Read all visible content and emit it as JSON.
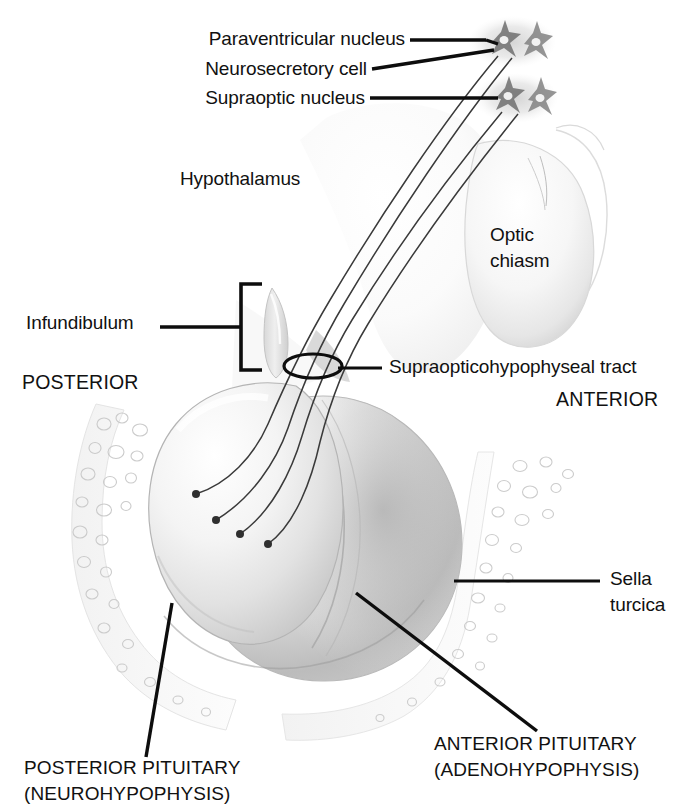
{
  "figure": {
    "background_color": "#ffffff",
    "ink_color": "#111111"
  },
  "labels": {
    "paraventricular_nucleus": "Paraventricular nucleus",
    "neurosecretory_cell": "Neurosecretory cell",
    "supraoptic_nucleus": "Supraoptic nucleus",
    "hypothalamus": "Hypothalamus",
    "optic_chiasm_line1": "Optic",
    "optic_chiasm_line2": "chiasm",
    "infundibulum": "Infundibulum",
    "posterior": "POSTERIOR",
    "anterior": "ANTERIOR",
    "supraopticohypophyseal_tract": "Supraopticohypophyseal tract",
    "sella_turcica_line1": "Sella",
    "sella_turcica_line2": "turcica",
    "posterior_pituitary_line1": "POSTERIOR PITUITARY",
    "posterior_pituitary_line2": "(NEUROHYPOPHYSIS)",
    "anterior_pituitary_line1": "ANTERIOR PITUITARY",
    "anterior_pituitary_line2": "(ADENOHYPOPHYSIS)"
  },
  "structures": [
    {
      "name": "paraventricular-nucleus",
      "description": "upper grey cell cluster with two star-shaped neurosecretory cells"
    },
    {
      "name": "supraoptic-nucleus",
      "description": "lower grey cell cluster with two star-shaped neurosecretory cells"
    },
    {
      "name": "optic-chiasm",
      "description": "large pale oval body, right of midline"
    },
    {
      "name": "infundibulum",
      "description": "pituitary stalk, curved sliver marked by bracket"
    },
    {
      "name": "supraopticohypophyseal-tract",
      "description": "bundle of axon fibres circled by an ellipse"
    },
    {
      "name": "posterior-pituitary",
      "description": "rounded left lobe, neurohypophysis, receives axon terminals"
    },
    {
      "name": "anterior-pituitary",
      "description": "larger shaded right lobe, adenohypophysis"
    },
    {
      "name": "sella-turcica",
      "description": "trabecular bone of sphenoid cradling the gland, left and right"
    }
  ],
  "axon_fibers": {
    "count": 4,
    "terminal_knobs": 4,
    "description": "fibres run from the nuclei through the infundibulum and end in knobs within the posterior pituitary"
  },
  "leaders": [
    {
      "name": "paraventricular-nucleus-leader",
      "style": "horizontal-then-diagonal"
    },
    {
      "name": "neurosecretory-cell-leader",
      "style": "diagonal"
    },
    {
      "name": "supraoptic-nucleus-leader",
      "style": "horizontal"
    },
    {
      "name": "infundibulum-leader",
      "style": "horizontal-with-bracket"
    },
    {
      "name": "supraopticohypophyseal-tract-leader",
      "style": "horizontal-with-ellipse"
    },
    {
      "name": "sella-turcica-leader",
      "style": "horizontal"
    },
    {
      "name": "posterior-pituitary-leader",
      "style": "diagonal"
    },
    {
      "name": "anterior-pituitary-leader",
      "style": "diagonal"
    }
  ]
}
